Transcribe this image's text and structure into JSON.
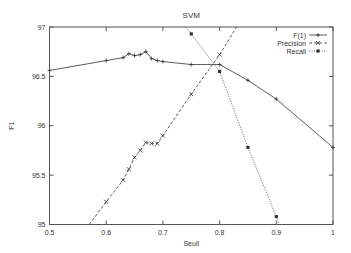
{
  "chart_data": {
    "type": "line",
    "title": "SVM",
    "xlabel": "Seuil",
    "ylabel": "F1",
    "xlim": [
      0.5,
      1.0
    ],
    "ylim": [
      95,
      97
    ],
    "xticks": [
      "0.5",
      "0.6",
      "0.7",
      "0.8",
      "0.9",
      "1"
    ],
    "yticks": [
      "95",
      "95.5",
      "96",
      "96.5",
      "97"
    ],
    "grid": false,
    "legend_position": "top-right",
    "series": [
      {
        "name": "F(1)",
        "style": "solid",
        "marker": "+",
        "x": [
          0.5,
          0.6,
          0.63,
          0.64,
          0.65,
          0.66,
          0.67,
          0.68,
          0.69,
          0.7,
          0.75,
          0.8,
          0.85,
          0.9,
          1.0
        ],
        "y": [
          96.56,
          96.66,
          96.69,
          96.73,
          96.71,
          96.72,
          96.75,
          96.68,
          96.66,
          96.65,
          96.62,
          96.62,
          96.46,
          96.27,
          95.78
        ]
      },
      {
        "name": "Precision",
        "style": "dashed",
        "marker": "x",
        "x": [
          0.57,
          0.6,
          0.63,
          0.64,
          0.65,
          0.66,
          0.67,
          0.68,
          0.69,
          0.7,
          0.75,
          0.8,
          0.83
        ],
        "y": [
          95.0,
          95.23,
          95.45,
          95.56,
          95.68,
          95.75,
          95.83,
          95.82,
          95.82,
          95.9,
          96.32,
          96.72,
          97.0
        ]
      },
      {
        "name": "Recall",
        "style": "dotted",
        "marker": "square",
        "x": [
          0.74,
          0.75,
          0.8,
          0.85,
          0.9,
          0.905
        ],
        "y": [
          97.0,
          96.93,
          96.55,
          95.78,
          95.08,
          95.0
        ]
      }
    ]
  }
}
